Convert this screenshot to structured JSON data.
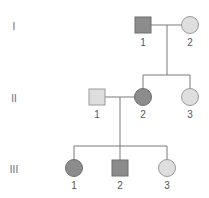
{
  "colors": {
    "affected_fill": "#8c8c8c",
    "affected_stroke": "#6e6e6e",
    "unaffected_fill": "#dedede",
    "unaffected_stroke": "#9a9a9a",
    "line": "#7a7a7a",
    "background": "#ffffff"
  },
  "generations": [
    {
      "label": "I",
      "y": 26
    },
    {
      "label": "II",
      "y": 98
    },
    {
      "label": "III",
      "y": 169
    }
  ],
  "individuals": [
    {
      "id": "I-1",
      "generation": "I",
      "number": "1",
      "sex": "male",
      "affected": true,
      "cx": 143,
      "cy": 25
    },
    {
      "id": "I-2",
      "generation": "I",
      "number": "2",
      "sex": "female",
      "affected": false,
      "cx": 190,
      "cy": 25
    },
    {
      "id": "II-1",
      "generation": "II",
      "number": "1",
      "sex": "male",
      "affected": false,
      "cx": 97,
      "cy": 97
    },
    {
      "id": "II-2",
      "generation": "II",
      "number": "2",
      "sex": "female",
      "affected": true,
      "cx": 143,
      "cy": 97
    },
    {
      "id": "II-3",
      "generation": "II",
      "number": "3",
      "sex": "female",
      "affected": false,
      "cx": 190,
      "cy": 97
    },
    {
      "id": "III-1",
      "generation": "III",
      "number": "1",
      "sex": "female",
      "affected": true,
      "cx": 74,
      "cy": 168
    },
    {
      "id": "III-2",
      "generation": "III",
      "number": "2",
      "sex": "male",
      "affected": true,
      "cx": 120,
      "cy": 168
    },
    {
      "id": "III-3",
      "generation": "III",
      "number": "3",
      "sex": "female",
      "affected": false,
      "cx": 167,
      "cy": 168
    }
  ],
  "matings": [
    {
      "partners": [
        "I-1",
        "I-2"
      ],
      "children": [
        "II-2",
        "II-3"
      ]
    },
    {
      "partners": [
        "II-1",
        "II-2"
      ],
      "children": [
        "III-1",
        "III-2",
        "III-3"
      ]
    }
  ],
  "legend": {
    "square": "male",
    "circle": "female",
    "shaded": "affected",
    "unshaded": "unaffected"
  }
}
